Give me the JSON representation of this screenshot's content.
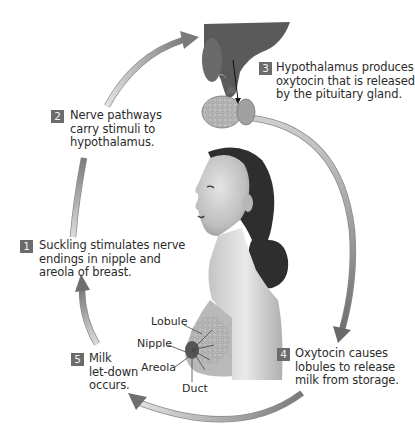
{
  "diagram": {
    "colors": {
      "badge": "#6b6b6b",
      "arrow_light": "#d9d9d9",
      "arrow_dark": "#7a7a7a",
      "text": "#2b2b2b",
      "background": "#ffffff"
    },
    "steps": [
      {
        "number": "1",
        "lines": [
          "Suckling stimulates nerve",
          "endings in nipple and",
          "areola of breast."
        ]
      },
      {
        "number": "2",
        "lines": [
          "Nerve pathways",
          "carry stimuli to",
          "hypothalamus."
        ]
      },
      {
        "number": "3",
        "lines": [
          "Hypothalamus produces",
          "oxytocin that is released",
          "by the pituitary gland."
        ]
      },
      {
        "number": "4",
        "lines": [
          "Oxytocin causes",
          "lobules to release",
          "milk from storage."
        ]
      },
      {
        "number": "5",
        "lines": [
          "Milk",
          "let-down",
          "occurs."
        ]
      }
    ],
    "anatomy_labels": {
      "lobule": "Lobule",
      "nipple": "Nipple",
      "areola": "Areola",
      "duct": "Duct"
    },
    "illustrations": {
      "brain": "hypothalamus-pituitary-illustration",
      "figure": "woman-profile-illustration",
      "breast": "breast-anatomy-illustration"
    }
  }
}
